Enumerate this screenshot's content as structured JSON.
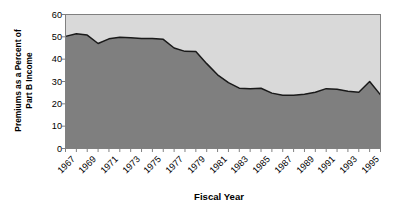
{
  "chart_data": {
    "type": "area",
    "title": "",
    "xlabel": "Fiscal Year",
    "ylabel": "Premiums as a Percent of Part B Income",
    "ylabel_lines": [
      "Premiums as a Percent of",
      "Part B Income"
    ],
    "ylim": [
      0,
      60
    ],
    "yticks": [
      0,
      10,
      20,
      30,
      40,
      50,
      60
    ],
    "ytick_labels": [
      "0",
      "10",
      "20",
      "30",
      "40",
      "50",
      "60"
    ],
    "xlim": [
      1967,
      1996
    ],
    "xticks": [
      1967,
      1969,
      1971,
      1973,
      1975,
      1977,
      1979,
      1981,
      1983,
      1985,
      1987,
      1989,
      1991,
      1993,
      1995
    ],
    "xtick_labels": [
      "1967",
      "1969",
      "1971",
      "1973",
      "1975",
      "1977",
      "1979",
      "1981",
      "1983",
      "1985",
      "1987",
      "1989",
      "1991",
      "1993",
      "1995"
    ],
    "grid": false,
    "legend": false,
    "x": [
      1967,
      1968,
      1969,
      1970,
      1971,
      1972,
      1973,
      1974,
      1975,
      1976,
      1977,
      1978,
      1979,
      1980,
      1981,
      1982,
      1983,
      1984,
      1985,
      1986,
      1987,
      1988,
      1989,
      1990,
      1991,
      1992,
      1993,
      1994,
      1995,
      1996
    ],
    "values": [
      50.2,
      51.4,
      50.8,
      47.0,
      49.1,
      49.8,
      49.6,
      49.2,
      49.3,
      48.9,
      45.0,
      43.5,
      43.4,
      38.0,
      33.0,
      29.5,
      27.0,
      26.8,
      27.0,
      24.8,
      23.8,
      23.8,
      24.3,
      25.2,
      26.8,
      26.5,
      25.6,
      25.2,
      30.0,
      24.0
    ],
    "series_name": "Premiums as a Percent of Part B Income",
    "area_fill_color": "#7f7f7f",
    "plot_background_color": "#d9d9d9",
    "line_color": "#1a1a1a",
    "axis_color": "#808080",
    "text_color": "#000000"
  },
  "axes": {
    "x_title": "Fiscal Year",
    "y_title_line1": "Premiums as a Percent of",
    "y_title_line2": "Part B Income"
  }
}
